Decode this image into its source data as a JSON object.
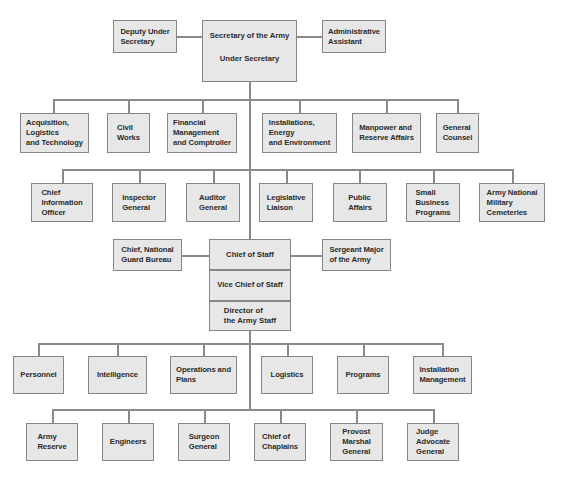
{
  "chart": {
    "top": {
      "deputy_under_secretary": "Deputy Under\nSecretary",
      "secretary": "Secretary of the Army",
      "under_secretary": "Under Secretary",
      "administrative_assistant": "Administrative\nAssistant"
    },
    "assistant_secretaries": [
      "Acquisition,\nLogistics\nand Technology",
      "Civil\nWorks",
      "Financial\nManagement\nand Comptroller",
      "Installations,\nEnergy\nand Environment",
      "Manpower and\nReserve Affairs",
      "General\nCounsel"
    ],
    "staff_offices": [
      "Chief\nInformation\nOfficer",
      "Inspector\nGeneral",
      "Auditor\nGeneral",
      "Legislative\nLiaison",
      "Public\nAffairs",
      "Small\nBusiness\nPrograms",
      "Army National\nMilitary\nCemeteries"
    ],
    "army_staff": {
      "chief_national_guard_bureau": "Chief, National\nGuard Bureau",
      "chief_of_staff": "Chief of Staff",
      "vice_chief_of_staff": "Vice Chief of Staff",
      "director_of_army_staff": "Director of\nthe Army Staff",
      "sergeant_major": "Sergeant Major\nof the Army"
    },
    "staff_directorates": [
      "Personnel",
      "Intelligence",
      "Operations and\nPlans",
      "Logistics",
      "Programs",
      "Installation\nManagement"
    ],
    "special_staff": [
      "Army\nReserve",
      "Engineers",
      "Surgeon\nGeneral",
      "Chief of\nChaplains",
      "Provost\nMarshal\nGeneral",
      "Judge\nAdvocate\nGeneral"
    ]
  }
}
